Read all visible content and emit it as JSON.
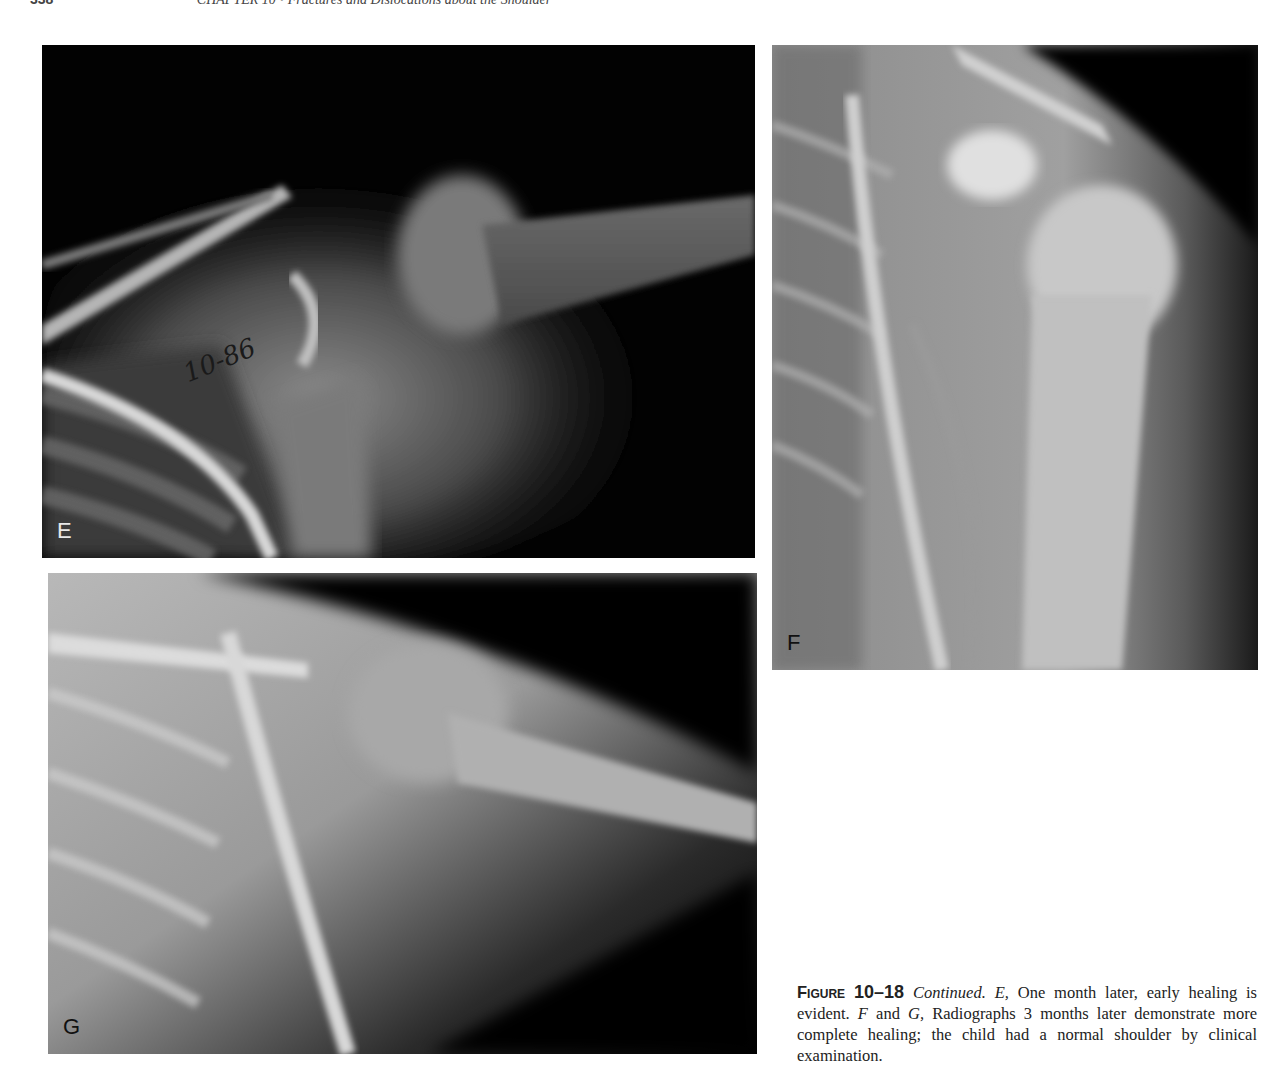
{
  "running_head": {
    "page_number": "338",
    "chapter": "CHAPTER 10 • Fractures and Dislocations about the Shoulder"
  },
  "figure": {
    "panels": [
      {
        "id": "E",
        "label": "E",
        "annotation": "10-86",
        "description": "Shoulder radiograph one month after injury, early healing"
      },
      {
        "id": "F",
        "label": "F",
        "description": "Shoulder radiograph 3 months later, AP view"
      },
      {
        "id": "G",
        "label": "G",
        "description": "Shoulder radiograph 3 months later"
      }
    ],
    "caption": {
      "figure_word": "Figure",
      "figure_number": "10–18",
      "continued": "Continued.",
      "e_label": "E,",
      "e_text": " One month later, early healing is evident. ",
      "f_label": "F",
      "and": " and ",
      "g_label": "G,",
      "fg_text": " Radiographs 3 months later demonstrate more complete healing; the child had a normal shoulder by clinical examination."
    }
  }
}
